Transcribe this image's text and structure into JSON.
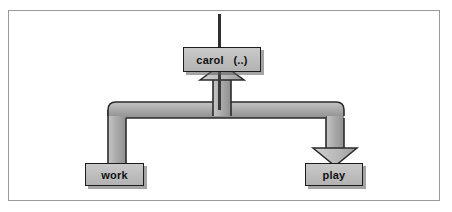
{
  "figure": {
    "type": "flow-diagram",
    "background_color": "#ffffff",
    "frame_color": "#9a9a9a"
  },
  "nodes": [
    {
      "id": "carol",
      "label": "carol   (..)",
      "role": "caller",
      "fill_color": "#bdbdbd",
      "border_color": "#1c1c1c",
      "text_color": "#111111"
    },
    {
      "id": "work",
      "label": "work",
      "role": "target",
      "fill_color": "#bdbdbd",
      "border_color": "#1c1c1c",
      "text_color": "#111111"
    },
    {
      "id": "play",
      "label": "play",
      "role": "target",
      "fill_color": "#bdbdbd",
      "border_color": "#1c1c1c",
      "text_color": "#111111"
    }
  ],
  "edges": [
    {
      "id": "entry-line",
      "from": "top-edge",
      "to": "carol",
      "style": "thin-line",
      "arrowhead": "none",
      "color": "#2a2a2a"
    },
    {
      "id": "return-to-carol",
      "from": "branch-bar",
      "to": "carol",
      "style": "thick-ribbon",
      "arrowhead": "up",
      "color": "#a8a8a8"
    },
    {
      "id": "carol-to-work",
      "from": "carol",
      "to": "work",
      "style": "thick-ribbon",
      "arrowhead": "none",
      "color": "#a8a8a8"
    },
    {
      "id": "carol-to-play",
      "from": "carol",
      "to": "play",
      "style": "thick-ribbon",
      "arrowhead": "down",
      "color": "#a8a8a8"
    }
  ],
  "palette": {
    "ribbon_light": "#c4c4c4",
    "ribbon_mid": "#a8a8a8",
    "ribbon_dark": "#8d8d8d",
    "ribbon_edge": "#2a2a2a",
    "box_fill": "#bdbdbd",
    "box_border": "#1c1c1c",
    "shadow": "#5a5a5a"
  }
}
